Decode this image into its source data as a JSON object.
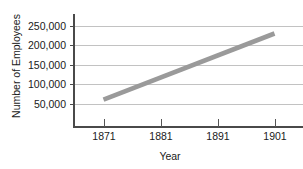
{
  "chart_data": {
    "type": "line",
    "title": "",
    "xlabel": "Year",
    "ylabel": "Number of Employees",
    "x": [
      1871,
      1901
    ],
    "values": [
      60000,
      230000
    ],
    "series": [
      {
        "name": "Employees",
        "x": [
          1871,
          1901
        ],
        "values": [
          60000,
          230000
        ]
      }
    ],
    "xticks": [
      "1871",
      "1881",
      "1891",
      "1901"
    ],
    "xtick_values": [
      1871,
      1881,
      1891,
      1901
    ],
    "yticks": [
      "50,000",
      "100,000",
      "150,000",
      "200,000",
      "250,000"
    ],
    "ytick_values": [
      50000,
      100000,
      150000,
      200000,
      250000
    ],
    "xlim": [
      1866,
      1906
    ],
    "ylim": [
      0,
      275000
    ],
    "grid": "horizontal",
    "legend": "none",
    "line_color": "#9a9a9a",
    "axis_color": "#4a4a4a",
    "grid_color": "#c2c2c2"
  },
  "annotations": {
    "clipped_title": ""
  }
}
